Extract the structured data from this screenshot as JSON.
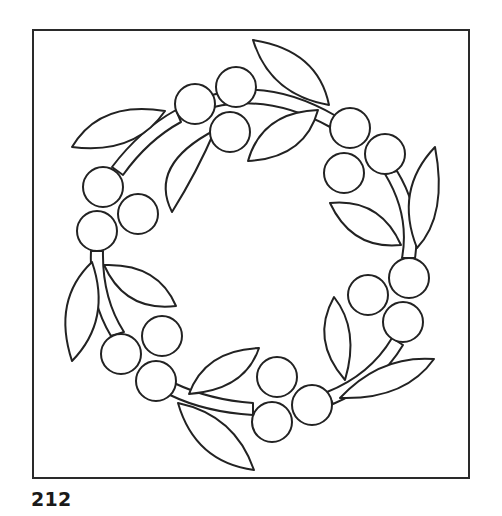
{
  "page": {
    "number": "212"
  },
  "colors": {
    "line": "#222222",
    "background": "#ffffff"
  },
  "pattern": {
    "type": "wreath",
    "branches": 6,
    "berry_count": 18,
    "leaf_count": 12
  }
}
